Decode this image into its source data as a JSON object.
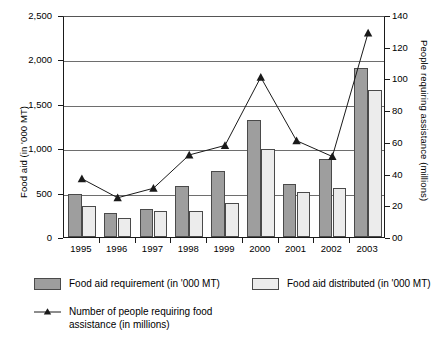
{
  "chart_data": {
    "type": "bar",
    "title": "",
    "xlabel": "",
    "ylabel": "Food aid (in '000 MT)",
    "y2label": "People requiring assistance (millions)",
    "categories": [
      "1995",
      "1996",
      "1997",
      "1998",
      "1999",
      "2000",
      "2001",
      "2002",
      "2003"
    ],
    "ylim": [
      0,
      2500
    ],
    "y2lim": [
      0,
      140
    ],
    "yticks": [
      "0",
      "500",
      "1,000",
      "1,500",
      "2,000",
      "2,500"
    ],
    "ytick_values": [
      0,
      500,
      1000,
      1500,
      2000,
      2500
    ],
    "y2ticks": [
      "00",
      "20",
      "40",
      "60",
      "80",
      "100",
      "120",
      "140"
    ],
    "y2tick_values": [
      0,
      20,
      40,
      60,
      80,
      100,
      120,
      140
    ],
    "grid": true,
    "legend_position": "below",
    "series": [
      {
        "name": "Food aid requirement (in '000 MT)",
        "kind": "bar",
        "axis": "left",
        "color": "#9e9e9e",
        "values": [
          480,
          270,
          320,
          570,
          740,
          1320,
          600,
          880,
          1900
        ]
      },
      {
        "name": "Food aid distributed (in '000 MT)",
        "kind": "bar",
        "axis": "left",
        "color": "#ececec",
        "values": [
          350,
          210,
          295,
          290,
          385,
          995,
          510,
          550,
          1650
        ]
      },
      {
        "name": "Number of people requiring food assistance (in millions)",
        "kind": "line",
        "axis": "right",
        "color": "#1a1a1a",
        "marker": "triangle",
        "values": [
          38,
          26,
          32,
          53,
          59,
          102,
          62,
          52,
          130
        ]
      }
    ]
  },
  "legend": {
    "items": [
      {
        "label": "Food aid requirement (in '000 MT)",
        "swatch": "bar-dark"
      },
      {
        "label": "Food aid distributed (in '000 MT)",
        "swatch": "bar-light"
      },
      {
        "label_line_1": "Number of people requiring food",
        "label_line_2": "assistance (in millions)",
        "swatch": "line-triangle"
      }
    ]
  }
}
